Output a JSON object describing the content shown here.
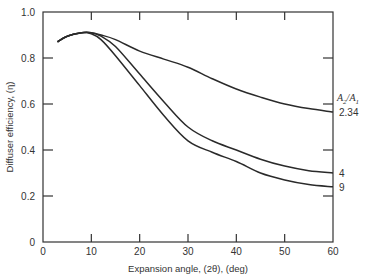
{
  "chart_data": {
    "type": "line",
    "title": "",
    "xlabel": "Expansion angle, (2θ), (deg)",
    "ylabel": "Diffuser efficiency, (η)",
    "xlim": [
      0,
      60
    ],
    "ylim": [
      0,
      1.0
    ],
    "x_ticks": [
      0,
      10,
      20,
      30,
      40,
      50,
      60
    ],
    "x_tick_labels": [
      "0",
      "10",
      "20",
      "30",
      "40",
      "50",
      "60"
    ],
    "y_ticks": [
      0,
      0.2,
      0.4,
      0.6,
      0.8,
      1.0
    ],
    "y_tick_labels": [
      "0",
      "0.2",
      "0.4",
      "0.6",
      "0.8",
      "1.0"
    ],
    "grid": false,
    "legend_title": "A2/A1",
    "legend_position": "right, inline labels at curve ends",
    "series": [
      {
        "name": "2.34",
        "x": [
          3,
          5,
          8,
          10,
          12,
          15,
          20,
          25,
          30,
          35,
          40,
          45,
          50,
          55,
          60
        ],
        "y": [
          0.87,
          0.895,
          0.91,
          0.91,
          0.9,
          0.88,
          0.83,
          0.795,
          0.76,
          0.71,
          0.665,
          0.63,
          0.6,
          0.58,
          0.565
        ]
      },
      {
        "name": "4",
        "x": [
          3,
          5,
          8,
          10,
          12,
          15,
          20,
          25,
          30,
          35,
          40,
          45,
          50,
          55,
          60
        ],
        "y": [
          0.87,
          0.895,
          0.91,
          0.91,
          0.895,
          0.85,
          0.73,
          0.61,
          0.5,
          0.44,
          0.4,
          0.36,
          0.33,
          0.31,
          0.3
        ]
      },
      {
        "name": "9",
        "x": [
          3,
          5,
          8,
          10,
          12,
          15,
          20,
          25,
          30,
          35,
          40,
          45,
          50,
          55,
          60
        ],
        "y": [
          0.87,
          0.895,
          0.91,
          0.905,
          0.88,
          0.81,
          0.68,
          0.55,
          0.44,
          0.39,
          0.35,
          0.3,
          0.27,
          0.25,
          0.24
        ]
      }
    ]
  }
}
